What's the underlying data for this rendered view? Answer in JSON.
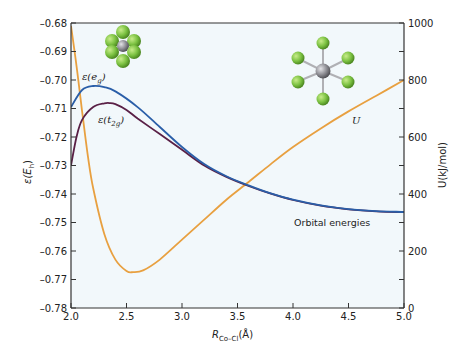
{
  "chart_data": {
    "type": "line",
    "title": "",
    "xlabel": "R_Co–Cl(Å)",
    "xlabel_main": "R",
    "xlabel_sub": "Co–Cl",
    "xlabel_unit": "(Å)",
    "ylabel_left": "ε(E_h)",
    "ylabel_right": "U(kJ/mol)",
    "xlim": [
      2.0,
      5.0
    ],
    "ylim_left": [
      -0.78,
      -0.68
    ],
    "ylim_right": [
      0,
      1000
    ],
    "grid": false,
    "x_ticks": [
      "2.0",
      "2.5",
      "3.0",
      "3.5",
      "4.0",
      "4.5",
      "5.0"
    ],
    "y_left_ticks": [
      "-0.68",
      "-0.69",
      "-0.70",
      "-0.71",
      "-0.72",
      "-0.73",
      "-0.74",
      "-0.75",
      "-0.76",
      "-0.77",
      "-0.78"
    ],
    "y_right_ticks": [
      "0",
      "200",
      "400",
      "600",
      "800",
      "1000"
    ],
    "series": [
      {
        "name": "ε(e_g)",
        "axis": "left",
        "color": "#2a5ea8",
        "x": [
          2.0,
          2.1,
          2.2,
          2.3,
          2.4,
          2.6,
          2.8,
          3.0,
          3.2,
          3.4,
          3.6,
          3.8,
          4.0,
          4.25,
          4.5,
          4.75,
          5.0
        ],
        "values": [
          -0.7095,
          -0.7035,
          -0.7021,
          -0.7025,
          -0.704,
          -0.7095,
          -0.7165,
          -0.7235,
          -0.7295,
          -0.7338,
          -0.737,
          -0.7398,
          -0.742,
          -0.744,
          -0.7453,
          -0.746,
          -0.7463
        ]
      },
      {
        "name": "ε(t_2g)",
        "axis": "left",
        "color": "#5a2046",
        "x": [
          2.0,
          2.05,
          2.1,
          2.2,
          2.3,
          2.35,
          2.4,
          2.5,
          2.6,
          2.8,
          3.0,
          3.2,
          3.4,
          3.6,
          3.8,
          4.0,
          4.25,
          4.5,
          4.75,
          5.0
        ],
        "values": [
          -0.73,
          -0.72,
          -0.714,
          -0.7095,
          -0.7082,
          -0.7081,
          -0.7085,
          -0.7105,
          -0.7135,
          -0.719,
          -0.7245,
          -0.73,
          -0.734,
          -0.7372,
          -0.7399,
          -0.7421,
          -0.7441,
          -0.7454,
          -0.7461,
          -0.7464
        ]
      },
      {
        "name": "U",
        "axis": "right",
        "color": "#e8a040",
        "x": [
          2.0,
          2.05,
          2.1,
          2.15,
          2.2,
          2.3,
          2.4,
          2.5,
          2.56,
          2.65,
          2.8,
          3.0,
          3.2,
          3.4,
          3.6,
          3.8,
          4.0,
          4.25,
          4.5,
          4.75,
          5.0
        ],
        "values": [
          990,
          850,
          690,
          540,
          420,
          260,
          170,
          130,
          126,
          132,
          170,
          240,
          310,
          380,
          442,
          505,
          565,
          630,
          690,
          745,
          800
        ]
      }
    ],
    "annotations": [
      {
        "text": "ε(e_g)",
        "x": 2.25,
        "y": -0.7005
      },
      {
        "text": "ε(t_2g)",
        "x": 2.32,
        "y": -0.7125
      },
      {
        "text": "U",
        "x": 4.4,
        "y_right": 700
      },
      {
        "text": "Orbital energies",
        "x": 3.9,
        "y": -0.7485
      }
    ],
    "insets": [
      {
        "name": "compact-octahedral-CoCl6-space-filling",
        "position": "top-left"
      },
      {
        "name": "expanded-octahedral-CoCl6-ball-and-stick",
        "position": "top-right"
      }
    ]
  },
  "labels": {
    "eg_main": "ε(e",
    "eg_sub": "g",
    "eg_close": ")",
    "t2g_main": "ε(t",
    "t2g_sub": "2g",
    "t2g_close": ")",
    "u_label": "U",
    "orbital_energies": "Orbital energies",
    "ylabel_left_main": "ε(E",
    "ylabel_left_sub": "h",
    "ylabel_left_close": ")",
    "ylabel_right": "U(kJ/mol)"
  },
  "colors": {
    "eg": "#2a5ea8",
    "t2g": "#5a2046",
    "U": "#e8a040",
    "plot_bg": "#f2f8fb",
    "axis": "#333333",
    "chlorine": "#7cc242",
    "cobalt": "#8f8f95"
  }
}
